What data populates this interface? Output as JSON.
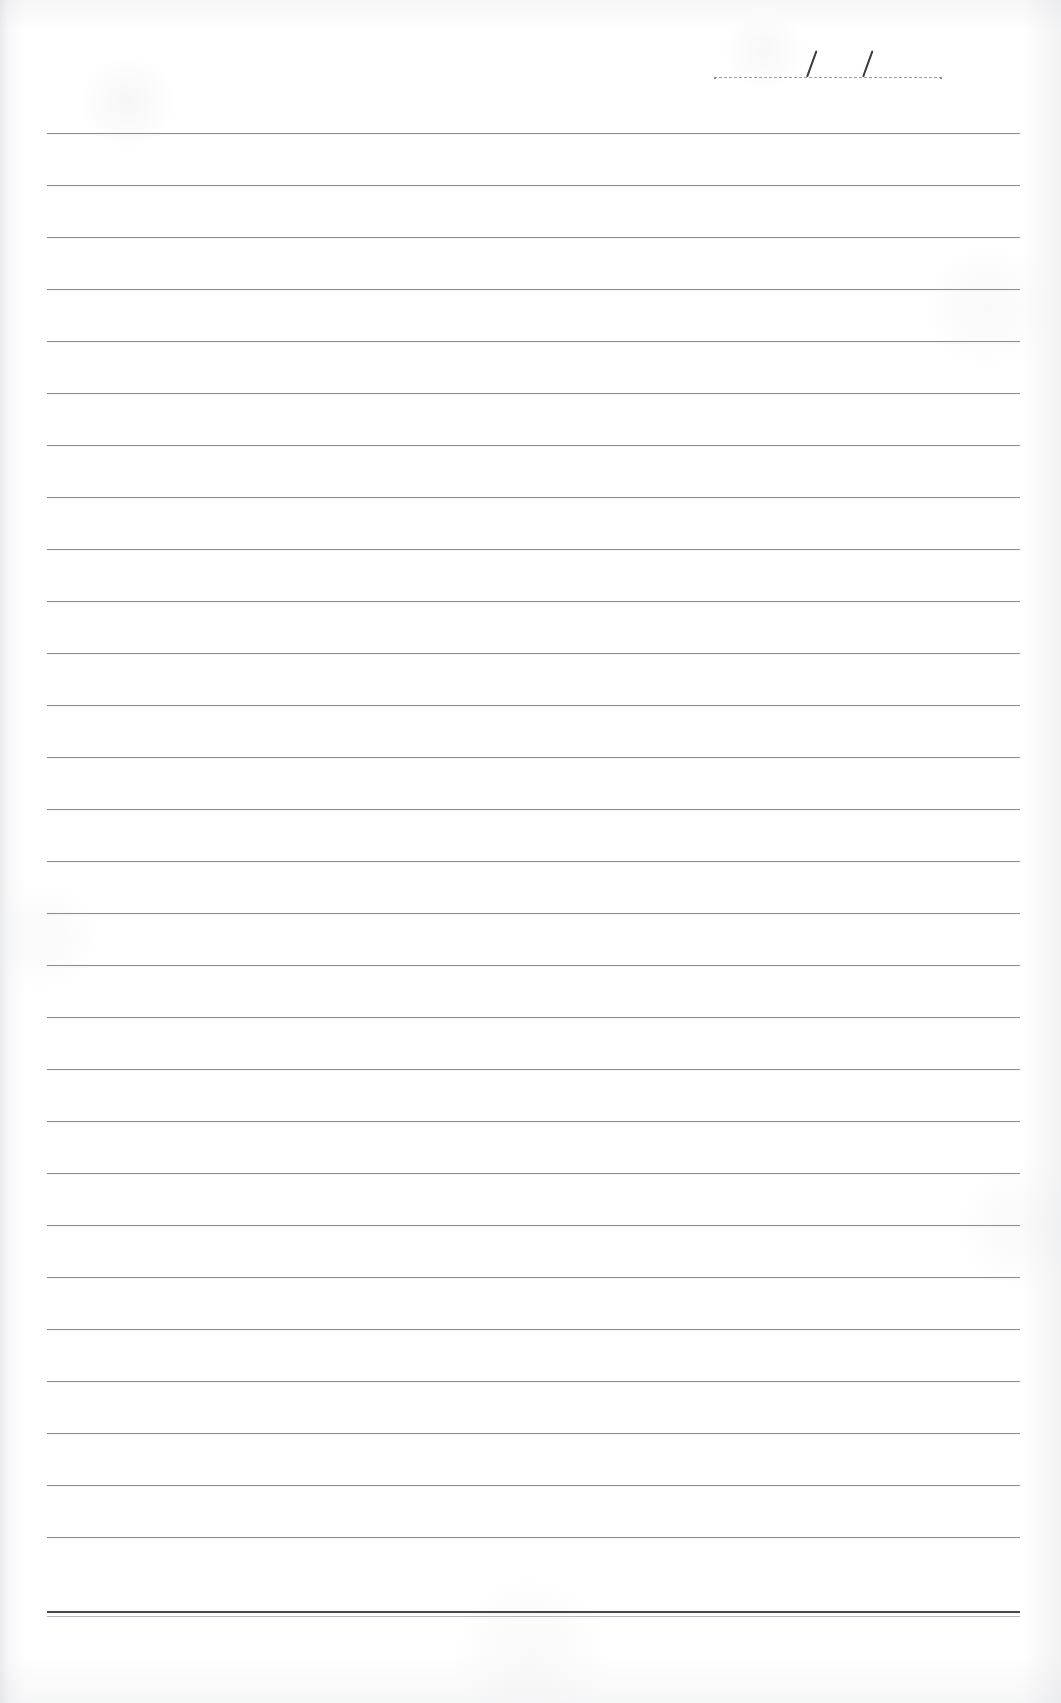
{
  "document": {
    "type": "lined-paper-scan",
    "title": "Blank ruled notebook page",
    "background_color": "#ffffff",
    "rule_color": "#7e8189",
    "heavy_rule_color": "#3f4147",
    "width_px": 1061,
    "height_px": 1703
  },
  "date_field": {
    "name": "date",
    "label": "",
    "value": "",
    "separator_1": "/",
    "separator_2": "/",
    "rule_style": "dotted",
    "left_px": 714,
    "top_px": 30,
    "width_px": 228,
    "baseline_y_px": 66,
    "slash_1_x_px": 92,
    "slash_2_x_px": 148
  },
  "ruling": {
    "left_margin_px": 47,
    "right_margin_px": 41,
    "line_width_px": 973,
    "first_line_y_px": 133,
    "line_spacing_px": 52,
    "line_count": 28,
    "heavy_bottom_rule": true,
    "heavy_rule_y_px": 1611,
    "lines_y_px": [
      133,
      185,
      237,
      289,
      341,
      393,
      445,
      497,
      549,
      601,
      653,
      705,
      757,
      809,
      861,
      913,
      965,
      1017,
      1069,
      1121,
      1173,
      1225,
      1277,
      1329,
      1381,
      1433,
      1485,
      1537
    ],
    "line_values": [
      "",
      "",
      "",
      "",
      "",
      "",
      "",
      "",
      "",
      "",
      "",
      "",
      "",
      "",
      "",
      "",
      "",
      "",
      "",
      "",
      "",
      "",
      "",
      "",
      "",
      "",
      "",
      ""
    ]
  }
}
